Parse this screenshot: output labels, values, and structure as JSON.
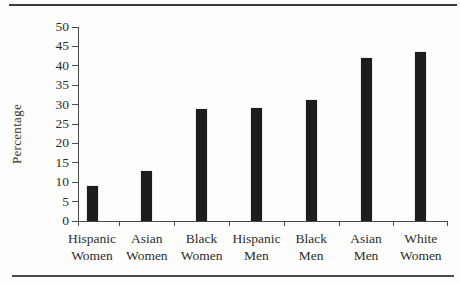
{
  "figure": {
    "background_color": "#fdfdfb",
    "top_rule_color": "#3d3d3d",
    "bottom_rule_color": "#4a4a4a"
  },
  "chart_data": {
    "type": "bar",
    "title": "",
    "xlabel": "",
    "ylabel": "Percentage",
    "categories": [
      "Hispanic Women",
      "Asian Women",
      "Black Women",
      "Hispanic Men",
      "Black Men",
      "Asian Men",
      "White Women"
    ],
    "values": [
      9,
      12.8,
      28.8,
      29.2,
      31.2,
      42,
      43.5
    ],
    "ylim": [
      0,
      50
    ],
    "ytick_step": 5,
    "grid": "off",
    "legend": "none",
    "bar_color": "#1d1d1d",
    "axis_color": "#4a4a4a",
    "text_color": "#2e2e2c"
  }
}
